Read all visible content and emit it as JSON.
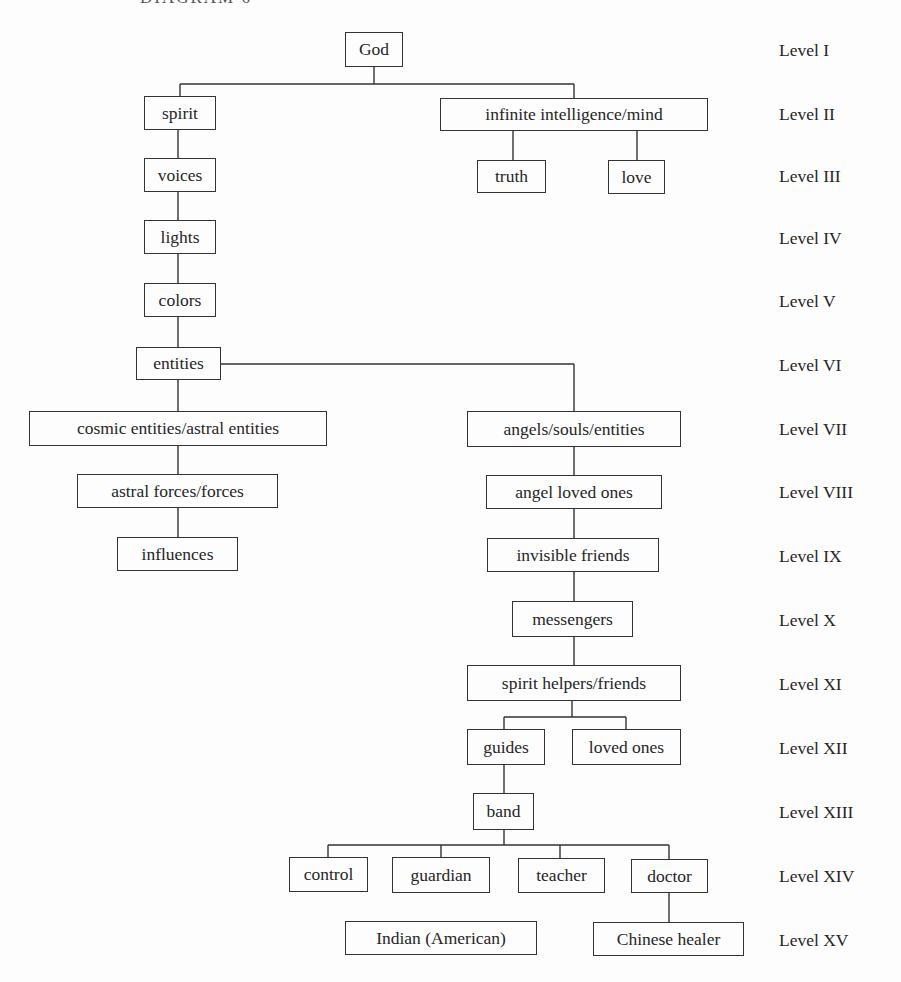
{
  "header": {
    "title": "DIAGRAM 6"
  },
  "nodes": {
    "god": "God",
    "spirit": "spirit",
    "infinite": "infinite intelligence/mind",
    "voices": "voices",
    "truth": "truth",
    "love": "love",
    "lights": "lights",
    "colors": "colors",
    "entities": "entities",
    "cosmic": "cosmic entities/astral entities",
    "angels": "angels/souls/entities",
    "astral_forces": "astral forces/forces",
    "angel_loved": "angel loved ones",
    "influences": "influences",
    "invisible": "invisible friends",
    "messengers": "messengers",
    "spirit_helpers": "spirit helpers/friends",
    "guides": "guides",
    "loved_ones": "loved ones",
    "band": "band",
    "control": "control",
    "guardian": "guardian",
    "teacher": "teacher",
    "doctor": "doctor",
    "indian": "Indian (American)",
    "chinese": "Chinese healer"
  },
  "levels": [
    "Level I",
    "Level II",
    "Level III",
    "Level IV",
    "Level V",
    "Level VI",
    "Level VII",
    "Level VIII",
    "Level IX",
    "Level X",
    "Level XI",
    "Level XII",
    "Level XIII",
    "Level XIV",
    "Level XV"
  ]
}
